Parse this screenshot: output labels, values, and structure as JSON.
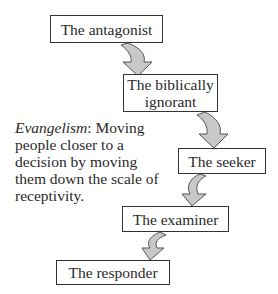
{
  "diagram": {
    "steps": [
      {
        "label": "The antagonist"
      },
      {
        "label": "The biblically ignorant",
        "line1": "The biblically",
        "line2": "ignorant"
      },
      {
        "label": "The seeker"
      },
      {
        "label": "The examiner"
      },
      {
        "label": "The responder"
      }
    ],
    "caption": {
      "term": "Evangelism",
      "definition": ": Moving people closer to a decision by moving them down the scale of receptivity."
    },
    "colors": {
      "arrow_fill": "#c8c8c8",
      "arrow_stroke": "#555555",
      "box_border": "#333333"
    }
  }
}
